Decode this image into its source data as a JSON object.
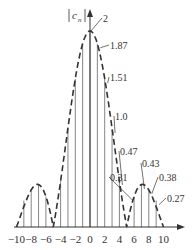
{
  "chart_data": {
    "type": "bar",
    "title": "",
    "ylabel": "|c_n|",
    "xlabel": "",
    "x": [
      -10,
      -9,
      -8,
      -7,
      -6,
      -5,
      -4,
      -3,
      -2,
      -1,
      0,
      1,
      2,
      3,
      4,
      5,
      6,
      7,
      8,
      9,
      10
    ],
    "values": [
      0,
      0.27,
      0.38,
      0.43,
      0.31,
      0,
      0.47,
      1.0,
      1.51,
      1.87,
      2,
      1.87,
      1.51,
      1.0,
      0.47,
      0,
      0.31,
      0.43,
      0.38,
      0.27,
      0
    ],
    "xticks": [
      "-10",
      "-8",
      "-6",
      "-4",
      "-2",
      "0",
      "2",
      "4",
      "6",
      "8",
      "10"
    ],
    "xtick_values": [
      -10,
      -8,
      -6,
      -4,
      -2,
      0,
      2,
      4,
      6,
      8,
      10
    ],
    "xlim": [
      -10,
      10.5
    ],
    "ylim": [
      0,
      2
    ],
    "envelope": "dashed |sinc|-like curve through line tops",
    "annotations": [
      {
        "n": 0,
        "label": "2"
      },
      {
        "n": 1,
        "label": "1.87"
      },
      {
        "n": 2,
        "label": "1.51"
      },
      {
        "n": 3,
        "label": "1.0"
      },
      {
        "n": 4,
        "label": "0.47"
      },
      {
        "n": 6,
        "label": "0.31"
      },
      {
        "n": 7,
        "label": "0.43"
      },
      {
        "n": 8,
        "label": "0.38"
      },
      {
        "n": 9,
        "label": "0.27"
      }
    ],
    "grid": false,
    "legend": null
  },
  "axis": {
    "ylabel_base": "c",
    "ylabel_sub": "n"
  }
}
